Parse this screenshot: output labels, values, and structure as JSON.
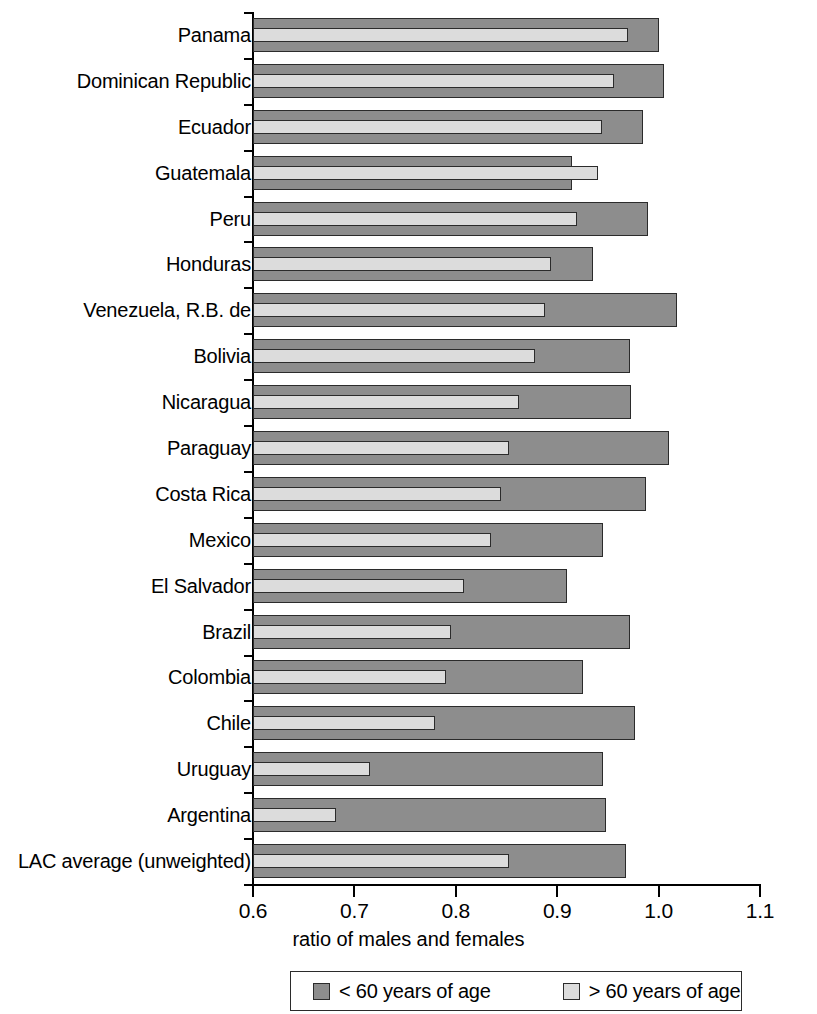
{
  "chart_data": {
    "type": "bar",
    "orientation": "horizontal",
    "title": "",
    "xlabel": "ratio of males and females",
    "ylabel": "",
    "xlim": [
      0.6,
      1.1
    ],
    "xticks": [
      "0.6",
      "0.7",
      "0.8",
      "0.9",
      "1.0",
      "1.1"
    ],
    "xtick_values": [
      0.6,
      0.7,
      0.8,
      0.9,
      1.0,
      1.1
    ],
    "grid": false,
    "legend_position": "bottom",
    "categories": [
      "Panama",
      "Dominican Republic",
      "Ecuador",
      "Guatemala",
      "Peru",
      "Honduras",
      "Venezuela, R.B. de",
      "Bolivia",
      "Nicaragua",
      "Paraguay",
      "Costa Rica",
      "Mexico",
      "El Salvador",
      "Brazil",
      "Colombia",
      "Chile",
      "Uruguay",
      "Argentina",
      "LAC average (unweighted)"
    ],
    "series": [
      {
        "name": "< 60 years of age",
        "color": "#8d8d8d",
        "values": [
          1.0,
          1.005,
          0.985,
          0.915,
          0.99,
          0.935,
          1.018,
          0.972,
          0.973,
          1.01,
          0.988,
          0.945,
          0.91,
          0.972,
          0.925,
          0.977,
          0.945,
          0.948,
          0.968
        ]
      },
      {
        "name": "> 60 years of age",
        "color": "#dcdcdc",
        "values": [
          0.97,
          0.956,
          0.944,
          0.94,
          0.92,
          0.894,
          0.888,
          0.878,
          0.862,
          0.852,
          0.845,
          0.835,
          0.808,
          0.795,
          0.79,
          0.779,
          0.715,
          0.682,
          0.852
        ]
      }
    ]
  },
  "legend": {
    "items": [
      {
        "label": "< 60 years of age",
        "swatch": "#8d8d8d"
      },
      {
        "label": "> 60 years of age",
        "swatch": "#dcdcdc"
      }
    ]
  }
}
